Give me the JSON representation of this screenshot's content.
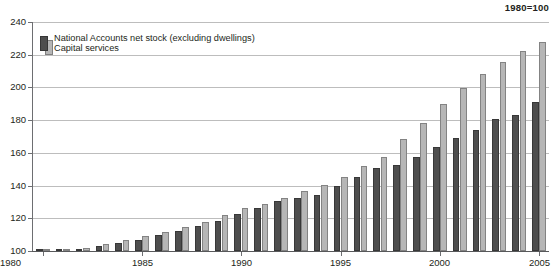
{
  "chart_data": {
    "type": "bar",
    "title": "1980=100",
    "xlabel": "",
    "ylabel": "",
    "ylim": [
      100,
      240
    ],
    "ytick_step": 20,
    "yticks": [
      100,
      120,
      140,
      160,
      180,
      200,
      220,
      240
    ],
    "grid": true,
    "legend_position": "top-left",
    "categories": [
      1980,
      1981,
      1982,
      1983,
      1984,
      1985,
      1986,
      1987,
      1988,
      1989,
      1990,
      1991,
      1992,
      1993,
      1994,
      1995,
      1996,
      1997,
      1998,
      1999,
      2000,
      2001,
      2002,
      2003,
      2004,
      2005
    ],
    "xtick_labels": [
      "1980",
      "1985",
      "1990",
      "1995",
      "2000",
      "2005"
    ],
    "xtick_years": [
      1980,
      1985,
      1990,
      1995,
      2000,
      2005
    ],
    "series": [
      {
        "name": "Capital services",
        "color": "#4e4e4e",
        "values": [
          100,
          100.5,
          101.5,
          103,
          105,
          107,
          109.5,
          112,
          115,
          118.5,
          122.5,
          126.5,
          130.5,
          132.5,
          134,
          139.5,
          145,
          151,
          152.5,
          157.5,
          163.5,
          169,
          174,
          180.5,
          183,
          191
        ]
      },
      {
        "name": "National Accounts net stock (excluding dwellings)",
        "color": "#b6b6b6",
        "values": [
          100.5,
          101,
          102,
          104,
          106.5,
          109,
          111.5,
          114.5,
          118,
          122,
          126.5,
          128.5,
          132.5,
          136.5,
          140.5,
          145.5,
          152,
          157.5,
          168.5,
          178,
          190,
          199.5,
          208,
          215.5,
          222,
          228
        ]
      }
    ]
  },
  "legend": {
    "net_stock_label": "National Accounts net stock (excluding dwellings)",
    "capital_services_label": "Capital services"
  }
}
